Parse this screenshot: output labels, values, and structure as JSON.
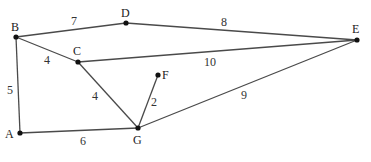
{
  "graph": {
    "nodes": [
      {
        "id": "A",
        "x": 20,
        "y": 133,
        "lx": 5,
        "ly": 138
      },
      {
        "id": "B",
        "x": 16,
        "y": 37,
        "lx": 11,
        "ly": 31
      },
      {
        "id": "C",
        "x": 78,
        "y": 62,
        "lx": 73,
        "ly": 55
      },
      {
        "id": "D",
        "x": 126,
        "y": 23,
        "lx": 121,
        "ly": 17
      },
      {
        "id": "E",
        "x": 357,
        "y": 40,
        "lx": 352,
        "ly": 33
      },
      {
        "id": "F",
        "x": 158,
        "y": 75,
        "lx": 162,
        "ly": 79
      },
      {
        "id": "G",
        "x": 138,
        "y": 128,
        "lx": 133,
        "ly": 144
      }
    ],
    "edges": [
      {
        "from": "B",
        "to": "D",
        "weight": "7",
        "lx": 71,
        "ly": 25
      },
      {
        "from": "D",
        "to": "E",
        "weight": "8",
        "lx": 221,
        "ly": 26
      },
      {
        "from": "B",
        "to": "C",
        "weight": "4",
        "lx": 44,
        "ly": 64
      },
      {
        "from": "C",
        "to": "E",
        "weight": "10",
        "lx": 204,
        "ly": 66
      },
      {
        "from": "B",
        "to": "A",
        "weight": "5",
        "lx": 7,
        "ly": 94
      },
      {
        "from": "C",
        "to": "G",
        "weight": "4",
        "lx": 92,
        "ly": 100
      },
      {
        "from": "F",
        "to": "G",
        "weight": "2",
        "lx": 151,
        "ly": 106
      },
      {
        "from": "G",
        "to": "E",
        "weight": "9",
        "lx": 241,
        "ly": 99
      },
      {
        "from": "A",
        "to": "G",
        "weight": "6",
        "lx": 80,
        "ly": 145
      }
    ]
  }
}
